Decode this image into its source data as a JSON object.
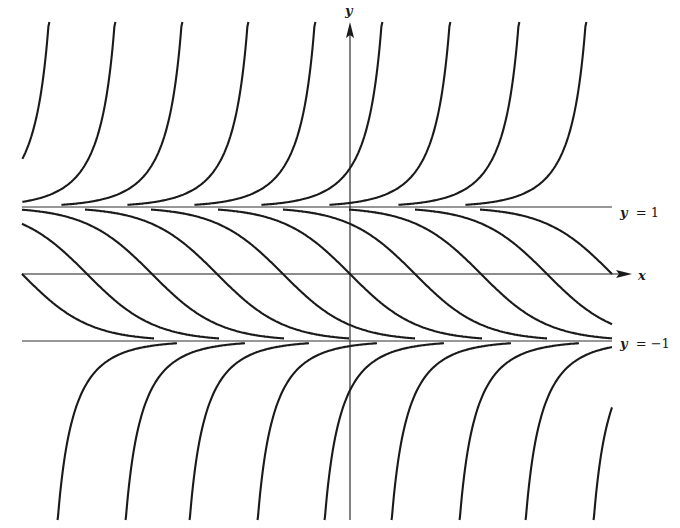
{
  "figure": {
    "axis_labels": {
      "x": "x",
      "y": "y"
    },
    "line_labels": {
      "upper": "= 1",
      "lower": "= −1",
      "var": "y"
    },
    "colors": {
      "ink": "#1a1a1a",
      "background": "#ffffff"
    },
    "layout": {
      "origin_px": [
        350,
        274
      ],
      "unit_y_px": 67,
      "unit_x_px": 67,
      "x_left_px": 22,
      "x_right_px": 612,
      "y_top_px": 22,
      "y_bottom_px": 520
    },
    "families": {
      "upper_blowup_asymptotes_px": [
        67,
        133,
        200,
        266,
        333,
        400,
        468,
        537,
        604
      ],
      "middle_center_px": [
        22,
        87,
        152,
        217,
        283,
        350,
        415,
        481,
        547,
        612
      ],
      "lower_blowup_asymptotes_px": [
        39,
        107,
        171,
        239,
        306,
        373,
        441,
        507,
        575
      ]
    }
  }
}
